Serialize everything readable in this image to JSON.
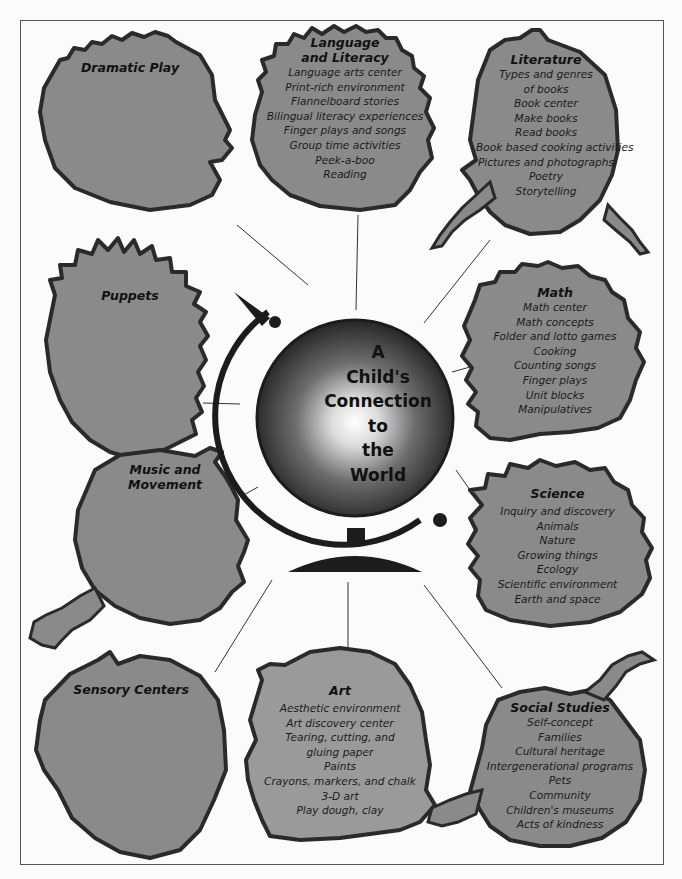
{
  "title": {
    "lines": [
      "A",
      "Child's",
      "Connection",
      "to",
      "the",
      "World"
    ]
  },
  "colors": {
    "head_fill": "#8a8a8a",
    "head_fill_light": "#9a9a9a",
    "outline": "#2a2a2a",
    "globe_dark": "#1c1c1c",
    "globe_light": "#ffffff",
    "frame": "#555555",
    "background": "#fbfbfb"
  },
  "nodes": {
    "dramatic_play": {
      "title": "Dramatic Play",
      "items": []
    },
    "language_literacy": {
      "title_lines": [
        "Language",
        "and Literacy"
      ],
      "items": [
        "Language arts center",
        "Print-rich environment",
        "Flannelboard stories",
        "Bilingual literacy experiences",
        "Finger plays and songs",
        "Group time activities",
        "Peek-a-boo",
        "Reading"
      ]
    },
    "literature": {
      "title": "Literature",
      "items": [
        "Types and genres",
        "of books",
        "Book center",
        "Make books",
        "Read books",
        "Book based cooking activities",
        "Pictures and photographs",
        "Poetry",
        "Storytelling"
      ]
    },
    "puppets": {
      "title": "Puppets",
      "items": []
    },
    "math": {
      "title": "Math",
      "items": [
        "Math center",
        "Math concepts",
        "Folder and lotto games",
        "Cooking",
        "Counting songs",
        "Finger plays",
        "Unit blocks",
        "Manipulatives"
      ]
    },
    "music_movement": {
      "title_lines": [
        "Music and",
        "Movement"
      ],
      "items": []
    },
    "science": {
      "title": "Science",
      "items": [
        "Inquiry and discovery",
        "Animals",
        "Nature",
        "Growing things",
        "Ecology",
        "Scientific environment",
        "Earth and space"
      ]
    },
    "sensory_centers": {
      "title": "Sensory Centers",
      "items": []
    },
    "art": {
      "title": "Art",
      "items": [
        "Aesthetic environment",
        "Art discovery center",
        "Tearing, cutting, and",
        "gluing paper",
        "Paints",
        "Crayons, markers, and chalk",
        "3-D art",
        "Play dough, clay"
      ]
    },
    "social_studies": {
      "title": "Social Studies",
      "items": [
        "Self-concept",
        "Families",
        "Cultural heritage",
        "Intergenerational programs",
        "Pets",
        "Community",
        "Children's museums",
        "Acts of kindness"
      ]
    }
  }
}
